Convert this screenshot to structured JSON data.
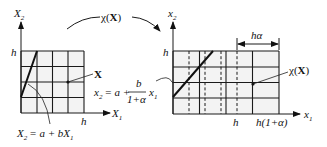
{
  "diagram": {
    "type": "coordinate-transformation",
    "transform_label": {
      "chi": "χ",
      "open": "(",
      "arg": "X",
      "close": ")"
    },
    "left_panel": {
      "y_axis_label": {
        "base": "X",
        "sub": "2"
      },
      "x_axis_label": {
        "base": "X",
        "sub": "1"
      },
      "h_y_label": "h",
      "h_x_label": "h",
      "grid": {
        "rows": 4,
        "cols": 4
      },
      "point_label": "X",
      "line_equation": {
        "lhs_base": "X",
        "lhs_sub": "2",
        "rhs": "= a + bX",
        "rhs_sub": "1"
      }
    },
    "right_panel": {
      "y_axis_label": {
        "base": "x",
        "sub": "2"
      },
      "x_axis_label": {
        "base": "x",
        "sub": "1"
      },
      "h_y_label": "h",
      "h_x_label": "h",
      "h_alpha_x_label": "h(1+α)",
      "dimension_label": "hα",
      "grid": {
        "rows": 4,
        "solid_cols": 4,
        "dashed_cols": 4
      },
      "point_label": {
        "chi": "χ",
        "open": "(",
        "arg": "X",
        "close": ")"
      },
      "line_equation": {
        "lhs_base": "x",
        "lhs_sub": "2",
        "eq": "= a +",
        "frac_num": "b",
        "frac_den": "1+α",
        "var_base": "x",
        "var_sub": "1"
      }
    }
  }
}
